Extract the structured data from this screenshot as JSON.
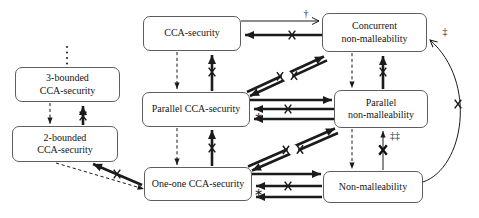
{
  "figure": {
    "background": "#ffffff",
    "line_color": "#1b1b1b",
    "box_border_color": "#5e5e5e",
    "nodes": [
      {
        "id": "cca",
        "label": "CCA-security"
      },
      {
        "id": "concurrent-nm",
        "label": "Concurrent\nnon-malleability"
      },
      {
        "id": "bounded-3",
        "label": "3-bounded\nCCA-security"
      },
      {
        "id": "parallel-cca",
        "label": "Parallel CCA-security"
      },
      {
        "id": "parallel-nm",
        "label": "Parallel\nnon-malleability"
      },
      {
        "id": "bounded-2",
        "label": "2-bounded\nCCA-security"
      },
      {
        "id": "one-one-cca",
        "label": "One-one CCA-security"
      },
      {
        "id": "nm",
        "label": "Non-malleability"
      }
    ],
    "annotations": {
      "dagger": "†",
      "double_dagger": "‡",
      "double_dagger_twice": "‡‡",
      "star": "∗"
    },
    "edges": [
      {
        "from": "CCA-security",
        "to": "Concurrent non-malleability",
        "arrow": "thin-solid",
        "label": "†"
      },
      {
        "from": "Concurrent non-malleability",
        "to": "CCA-security",
        "arrow": "bold-solid",
        "crossed_out": true
      },
      {
        "from": "CCA-security",
        "to": "Parallel CCA-security",
        "arrow": "dashed"
      },
      {
        "from": "Parallel CCA-security",
        "to": "CCA-security",
        "arrow": "bold-solid",
        "crossed_out": true
      },
      {
        "from": "ellipsis-above",
        "to": "3-bounded CCA-security",
        "arrow": "dotted"
      },
      {
        "from": "3-bounded CCA-security",
        "to": "2-bounded CCA-security",
        "arrow": "dashed"
      },
      {
        "from": "2-bounded CCA-security",
        "to": "3-bounded CCA-security",
        "arrow": "bold-solid",
        "crossed_out": true
      },
      {
        "from": "2-bounded CCA-security",
        "to": "One-one CCA-security",
        "arrow": "dashed"
      },
      {
        "from": "One-one CCA-security",
        "to": "2-bounded CCA-security",
        "arrow": "bold-solid",
        "crossed_out": true
      },
      {
        "from": "Parallel CCA-security",
        "to": "One-one CCA-security",
        "arrow": "dashed"
      },
      {
        "from": "One-one CCA-security",
        "to": "Parallel CCA-security",
        "arrow": "bold-solid",
        "crossed_out": true
      },
      {
        "from": "Parallel CCA-security",
        "to": "Concurrent non-malleability",
        "arrow": "bold-solid-pair",
        "crossed_out": true
      },
      {
        "from": "Concurrent non-malleability",
        "to": "Parallel CCA-security",
        "arrow": "bold-solid-pair",
        "crossed_out": true
      },
      {
        "from": "Concurrent non-malleability",
        "to": "Parallel non-malleability",
        "arrow": "dashed"
      },
      {
        "from": "Parallel non-malleability",
        "to": "Concurrent non-malleability",
        "arrow": "bold-solid",
        "crossed_out": true
      },
      {
        "from": "Parallel CCA-security",
        "to": "Parallel non-malleability",
        "arrow": "bold-solid"
      },
      {
        "from": "Parallel non-malleability",
        "to": "Parallel CCA-security",
        "arrow": "bold-solid",
        "crossed_out": true
      },
      {
        "from": "Parallel non-malleability",
        "to": "Parallel CCA-security",
        "arrow": "bold-solid",
        "label": "∗"
      },
      {
        "from": "One-one CCA-security",
        "to": "Parallel non-malleability",
        "arrow": "bold-solid-pair",
        "crossed_out": true
      },
      {
        "from": "Parallel non-malleability",
        "to": "One-one CCA-security",
        "arrow": "bold-solid-pair",
        "crossed_out": true
      },
      {
        "from": "Parallel non-malleability",
        "to": "Non-malleability",
        "arrow": "dashed"
      },
      {
        "from": "Non-malleability",
        "to": "Parallel non-malleability",
        "arrow": "thin-solid",
        "crossed_out": true,
        "label": "‡‡"
      },
      {
        "from": "One-one CCA-security",
        "to": "Non-malleability",
        "arrow": "bold-solid"
      },
      {
        "from": "Non-malleability",
        "to": "One-one CCA-security",
        "arrow": "bold-solid",
        "crossed_out": true
      },
      {
        "from": "Non-malleability",
        "to": "One-one CCA-security",
        "arrow": "bold-solid",
        "label": "∗"
      },
      {
        "from": "Non-malleability",
        "to": "Concurrent non-malleability",
        "arrow": "thin-curved",
        "crossed_out": true,
        "label": "‡"
      }
    ]
  }
}
